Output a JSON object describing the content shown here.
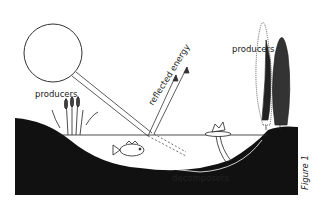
{
  "diagram": {
    "figure_label": "Figure 1",
    "labels": {
      "producers_left": "producers",
      "producers_right": "producers",
      "reflected_energy": "reflected energy",
      "decomposers": "decomposers"
    },
    "elements": [
      "sun",
      "sunlight-beam",
      "reflected-energy-arrows",
      "transmitted-light-arrows",
      "cattails",
      "fish",
      "water-lily",
      "trees",
      "pond-basin",
      "water-surface"
    ],
    "colors": {
      "ink": "#222222",
      "ground": "#111111",
      "paper": "#ffffff"
    }
  }
}
